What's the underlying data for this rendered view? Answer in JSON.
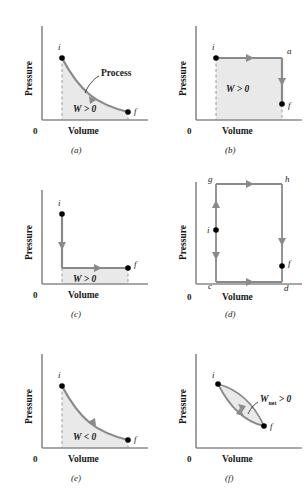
{
  "figure": {
    "axis": {
      "ylabel": "Pressure",
      "xlabel": "Volume",
      "origin": "0"
    },
    "colors": {
      "axis": "#8a8a8a",
      "path": "#8a8a8a",
      "shade": "#e9e9e9",
      "point": "#000000",
      "text": "#1a1a1a"
    },
    "panels": [
      {
        "id": "a",
        "caption": "(a)",
        "ylabel": "Pressure",
        "xlabel": "Volume",
        "origin": "0",
        "work_label": "W > 0",
        "work_symbol": "W",
        "work_relation": "> 0",
        "annotation": "Process",
        "points": [
          {
            "name": "i",
            "label": "i"
          },
          {
            "name": "f",
            "label": "f"
          }
        ],
        "path_type": "curve-expansion",
        "direction": "right",
        "shaded": true
      },
      {
        "id": "b",
        "caption": "(b)",
        "ylabel": "Pressure",
        "xlabel": "Volume",
        "origin": "0",
        "work_label": "W > 0",
        "work_symbol": "W",
        "work_relation": "> 0",
        "annotation": "",
        "points": [
          {
            "name": "i",
            "label": "i"
          },
          {
            "name": "a",
            "label": "a"
          },
          {
            "name": "f",
            "label": "f"
          }
        ],
        "path_type": "isobaric-then-isochoric",
        "direction": "right-then-down",
        "shaded": true
      },
      {
        "id": "c",
        "caption": "(c)",
        "ylabel": "Pressure",
        "xlabel": "Volume",
        "origin": "0",
        "work_label": "W > 0",
        "work_symbol": "W",
        "work_relation": "> 0",
        "annotation": "",
        "points": [
          {
            "name": "i",
            "label": "i"
          },
          {
            "name": "f",
            "label": "f"
          }
        ],
        "path_type": "isochoric-then-isobaric",
        "direction": "down-then-right",
        "shaded": true
      },
      {
        "id": "d",
        "caption": "(d)",
        "ylabel": "Pressure",
        "xlabel": "Volume",
        "origin": "0",
        "work_label": "",
        "work_symbol": "",
        "work_relation": "",
        "annotation": "",
        "points": [
          {
            "name": "g",
            "label": "g"
          },
          {
            "name": "h",
            "label": "h"
          },
          {
            "name": "i",
            "label": "i"
          },
          {
            "name": "f",
            "label": "f"
          },
          {
            "name": "c",
            "label": "c"
          },
          {
            "name": "d",
            "label": "d"
          }
        ],
        "path_type": "rectangular-circuit",
        "direction": "up-right-down-right",
        "shaded": false
      },
      {
        "id": "e",
        "caption": "(e)",
        "ylabel": "Pressure",
        "xlabel": "Volume",
        "origin": "0",
        "work_label": "W < 0",
        "work_symbol": "W",
        "work_relation": "< 0",
        "annotation": "",
        "points": [
          {
            "name": "i",
            "label": "i"
          },
          {
            "name": "f",
            "label": "f"
          }
        ],
        "path_type": "curve-compression",
        "direction": "left",
        "shaded": true
      },
      {
        "id": "f",
        "caption": "(f)",
        "ylabel": "Pressure",
        "xlabel": "Volume",
        "origin": "0",
        "work_label": "Wnet > 0",
        "work_symbol": "W",
        "work_subscript": "net",
        "work_relation": "> 0",
        "annotation": "",
        "points": [
          {
            "name": "i",
            "label": "i"
          },
          {
            "name": "f",
            "label": "f"
          }
        ],
        "path_type": "closed-cycle-loop",
        "direction": "clockwise",
        "shaded": true
      }
    ]
  }
}
